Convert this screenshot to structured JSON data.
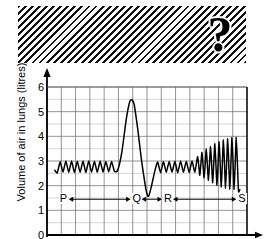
{
  "redaction": {
    "present": true,
    "marker": "?",
    "marker_name": "question-mark"
  },
  "chart_data": {
    "type": "line",
    "title": "",
    "xlabel": "",
    "ylabel": "Volume of air in lungs (litres)",
    "ylim": [
      0,
      6
    ],
    "yticks": [
      0,
      1,
      2,
      3,
      4,
      5,
      6
    ],
    "ytick_labels": [
      "0",
      "1",
      "2",
      "3",
      "4",
      "5",
      "6"
    ],
    "xlim": [
      0,
      14
    ],
    "xticks": [
      0,
      1,
      2,
      3,
      4,
      5,
      6,
      7,
      8,
      9,
      10,
      11,
      12,
      13,
      14
    ],
    "xtick_labels": [],
    "grid": true,
    "legend": null,
    "axis_arrows": [
      "y-up",
      "x-right"
    ],
    "annotations": [
      {
        "label": "P",
        "x": 1.1,
        "y": 1.45,
        "type": "phase-marker"
      },
      {
        "label": "Q",
        "x": 6.2,
        "y": 1.45,
        "type": "phase-marker"
      },
      {
        "label": "R",
        "x": 8.4,
        "y": 1.45,
        "type": "phase-marker"
      },
      {
        "label": "S",
        "x": 13.6,
        "y": 1.45,
        "type": "phase-marker"
      }
    ],
    "span_arrows": [
      {
        "from": "P",
        "to": "Q",
        "y": 1.45
      },
      {
        "from": "Q",
        "to": "R",
        "y": 1.45
      },
      {
        "from": "R",
        "to": "S",
        "y": 1.45
      }
    ],
    "series": [
      {
        "name": "Volume of air in lungs",
        "description": "Spirometer trace: quiet tidal breathing, then one deep breath (forced vital capacity), then quiet breathing, then rapid deepening breathing",
        "points": [
          [
            0.55,
            2.62
          ],
          [
            0.72,
            2.52
          ],
          [
            0.92,
            2.97
          ],
          [
            1.12,
            2.55
          ],
          [
            1.32,
            3.0
          ],
          [
            1.52,
            2.54
          ],
          [
            1.72,
            3.0
          ],
          [
            1.92,
            2.53
          ],
          [
            2.12,
            2.99
          ],
          [
            2.32,
            2.54
          ],
          [
            2.52,
            3.0
          ],
          [
            2.72,
            2.53
          ],
          [
            2.92,
            3.0
          ],
          [
            3.12,
            2.55
          ],
          [
            3.32,
            2.99
          ],
          [
            3.52,
            2.54
          ],
          [
            3.72,
            3.0
          ],
          [
            3.92,
            2.55
          ],
          [
            4.12,
            2.98
          ],
          [
            4.32,
            2.56
          ],
          [
            4.52,
            2.98
          ],
          [
            4.72,
            2.58
          ],
          [
            4.95,
            2.62
          ],
          [
            5.25,
            3.4
          ],
          [
            5.55,
            4.7
          ],
          [
            5.8,
            5.42
          ],
          [
            5.95,
            5.48
          ],
          [
            6.1,
            5.3
          ],
          [
            6.35,
            4.3
          ],
          [
            6.6,
            3.1
          ],
          [
            6.85,
            2.1
          ],
          [
            7.02,
            1.62
          ],
          [
            7.12,
            1.58
          ],
          [
            7.3,
            1.95
          ],
          [
            7.55,
            2.6
          ],
          [
            7.75,
            2.96
          ],
          [
            7.95,
            2.52
          ],
          [
            8.15,
            2.98
          ],
          [
            8.35,
            2.54
          ],
          [
            8.55,
            2.98
          ],
          [
            8.75,
            2.55
          ],
          [
            8.95,
            2.99
          ],
          [
            9.15,
            2.52
          ],
          [
            9.35,
            3.0
          ],
          [
            9.55,
            2.54
          ],
          [
            9.75,
            2.99
          ],
          [
            9.95,
            2.53
          ],
          [
            10.15,
            3.0
          ],
          [
            10.35,
            2.55
          ],
          [
            10.55,
            3.18
          ],
          [
            10.7,
            2.42
          ],
          [
            10.85,
            3.35
          ],
          [
            11.0,
            2.32
          ],
          [
            11.15,
            3.48
          ],
          [
            11.3,
            2.22
          ],
          [
            11.45,
            3.58
          ],
          [
            11.6,
            2.12
          ],
          [
            11.75,
            3.7
          ],
          [
            11.9,
            2.02
          ],
          [
            12.05,
            3.78
          ],
          [
            12.2,
            1.95
          ],
          [
            12.35,
            3.85
          ],
          [
            12.5,
            1.9
          ],
          [
            12.65,
            3.9
          ],
          [
            12.8,
            1.86
          ],
          [
            12.95,
            3.95
          ],
          [
            13.1,
            1.84
          ],
          [
            13.25,
            3.96
          ],
          [
            13.4,
            1.82
          ],
          [
            13.5,
            1.84
          ]
        ]
      }
    ]
  }
}
